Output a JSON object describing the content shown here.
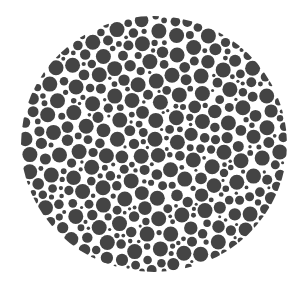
{
  "image": {
    "description": "Grayscale color-vision test plate made of packed dots",
    "background": "#ffffff",
    "dot_color": "#444444",
    "plate": {
      "cx": 154,
      "cy": 144,
      "rx": 133,
      "ry": 128
    },
    "dot_radius_range": [
      1.5,
      7.5
    ],
    "gap": 1.6,
    "seed": 7,
    "attempts": 9000
  }
}
